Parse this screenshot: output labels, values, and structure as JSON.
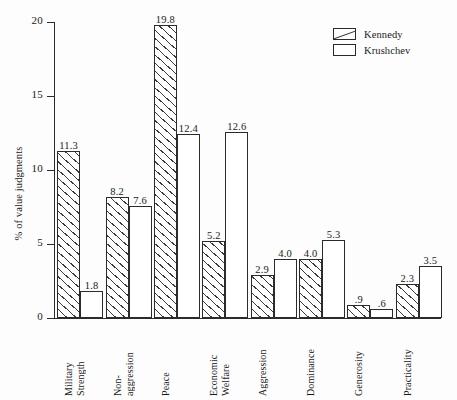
{
  "chart_data": {
    "type": "bar",
    "title": "",
    "xlabel": "",
    "ylabel": "% of value judgments",
    "ylim": [
      0,
      20
    ],
    "yticks": [
      "0",
      "5",
      "10",
      "15",
      "20"
    ],
    "grid": false,
    "legend_position": "top-right",
    "categories": [
      "Military\nStrength",
      "Non-\naggression",
      "Peace",
      "Economic\nWelfare",
      "Aggression",
      "Dominance",
      "Generosity",
      "Practicality"
    ],
    "series": [
      {
        "name": "Kennedy",
        "fill": "hatched",
        "values": [
          11.3,
          8.2,
          19.8,
          5.2,
          2.9,
          4.0,
          0.9,
          2.3
        ],
        "labels": [
          "11.3",
          "8.2",
          "19.8",
          "5.2",
          "2.9",
          "4.0",
          ".9",
          "2.3"
        ]
      },
      {
        "name": "Krushchev",
        "fill": "plain",
        "values": [
          1.8,
          7.6,
          12.4,
          12.6,
          4.0,
          5.3,
          0.6,
          3.5
        ],
        "labels": [
          "1.8",
          "7.6",
          "12.4",
          "12.6",
          "4.0",
          "5.3",
          ".6",
          "3.5"
        ]
      }
    ]
  },
  "legend": {
    "items": [
      {
        "label": "Kennedy"
      },
      {
        "label": "Krushchev"
      }
    ]
  },
  "colors": {
    "ink": "#2b2b2b",
    "background": "#fdfdfd",
    "hatch": "#3a3a3a"
  }
}
